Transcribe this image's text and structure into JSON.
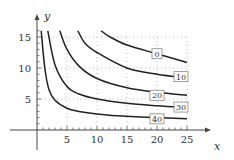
{
  "chart_data": {
    "type": "line",
    "title": "",
    "xlabel": "x",
    "ylabel": "y",
    "xlim": [
      0,
      27
    ],
    "ylim": [
      0,
      17
    ],
    "x_ticks": [
      5,
      10,
      15,
      20,
      25
    ],
    "y_ticks": [
      5,
      10,
      15
    ],
    "x_tick_labels": [
      "5",
      "10",
      "15",
      "20",
      "25"
    ],
    "y_tick_labels": [
      "5",
      "10",
      "15"
    ],
    "grid": "dotted at x=5,10,15,20,25 and y=5,10,15",
    "legend": "inline boxed labels on curves",
    "series": [
      {
        "name": "0",
        "label_pos": [
          20,
          12.3
        ],
        "points": [
          [
            10.7,
            16
          ],
          [
            12,
            15.1
          ],
          [
            15,
            13.7
          ],
          [
            20,
            12.3
          ],
          [
            25,
            10.9
          ]
        ]
      },
      {
        "name": "10",
        "label_pos": [
          24,
          8.6
        ],
        "points": [
          [
            6.8,
            16
          ],
          [
            8,
            14
          ],
          [
            10,
            12.5
          ],
          [
            15,
            10.0
          ],
          [
            20,
            9.0
          ],
          [
            25,
            8.4
          ]
        ]
      },
      {
        "name": "20",
        "label_pos": [
          20,
          5.6
        ],
        "points": [
          [
            3.8,
            16
          ],
          [
            5,
            13
          ],
          [
            7,
            10.3
          ],
          [
            10,
            8.3
          ],
          [
            15,
            6.8
          ],
          [
            20,
            6.1
          ],
          [
            25,
            5.6
          ]
        ]
      },
      {
        "name": "30",
        "label_pos": [
          24,
          3.7
        ],
        "points": [
          [
            1.8,
            16
          ],
          [
            3,
            10.5
          ],
          [
            5,
            7.0
          ],
          [
            7,
            5.8
          ],
          [
            10,
            5.0
          ],
          [
            15,
            4.3
          ],
          [
            20,
            3.9
          ],
          [
            25,
            3.6
          ]
        ]
      },
      {
        "name": "40",
        "label_pos": [
          20,
          1.8
        ],
        "points": [
          [
            0.7,
            16
          ],
          [
            1.3,
            10
          ],
          [
            2,
            6.5
          ],
          [
            3,
            4.8
          ],
          [
            5,
            3.5
          ],
          [
            7,
            3.0
          ],
          [
            10,
            2.6
          ],
          [
            15,
            2.2
          ],
          [
            20,
            2.0
          ],
          [
            25,
            1.8
          ]
        ]
      }
    ]
  },
  "axes": {
    "x_label": "x",
    "y_label": "y"
  },
  "colors": {
    "curve": "#222222",
    "axis": "#444444",
    "grid": "#aaaaaa"
  }
}
